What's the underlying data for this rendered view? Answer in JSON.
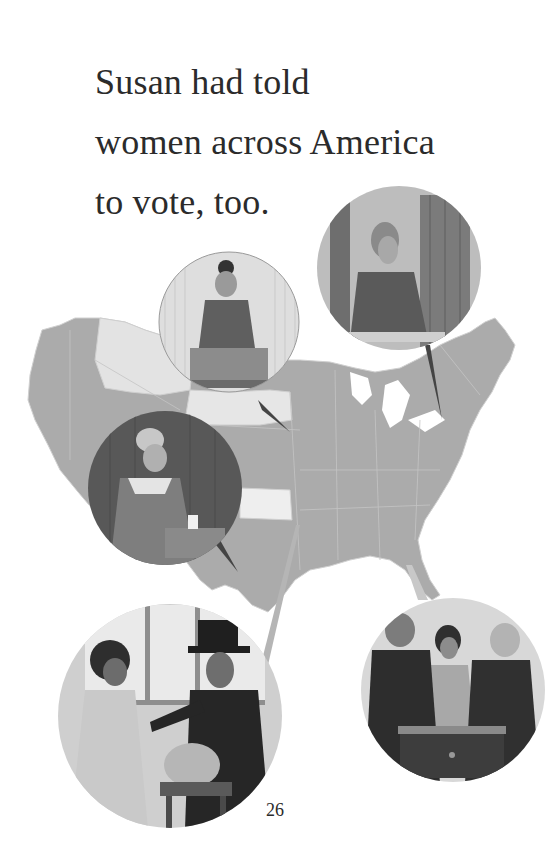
{
  "page": {
    "text_lines": [
      "Susan had told",
      "women across America",
      "to vote, too."
    ],
    "page_number": "26"
  },
  "illustration": {
    "map": "map-of-united-states",
    "vignettes": [
      {
        "id": "woman-bun-ballot-box",
        "desc": "woman with hair bun dropping ballot into box"
      },
      {
        "id": "woman-writing-booth",
        "desc": "woman writing ballot at booth"
      },
      {
        "id": "older-woman-ballot-box",
        "desc": "older woman placing ballot in box"
      },
      {
        "id": "woman-and-man-top-hat",
        "desc": "woman handing ballot to man in top hat near glass bowl"
      },
      {
        "id": "woman-between-two-men",
        "desc": "woman between two men behind ballot chest"
      }
    ],
    "colors": {
      "map_fill": "#a9a9a9",
      "map_light": "#e6e6e6",
      "map_border": "#c9c9c9",
      "text": "#2b2b2b"
    }
  }
}
